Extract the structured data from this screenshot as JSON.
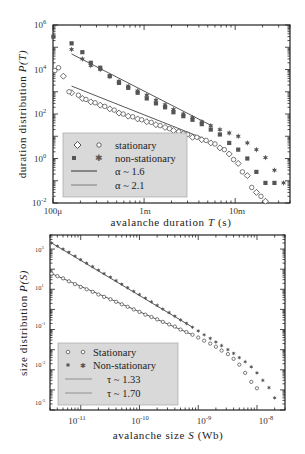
{
  "chart_data": [
    {
      "type": "scatter",
      "title": "",
      "xlabel": "avalanche duration T (s)",
      "ylabel": "duration distribution P(T)",
      "xscale": "log",
      "yscale": "log",
      "xlim": [
        0.0001,
        0.04
      ],
      "ylim": [
        0.01,
        1000000
      ],
      "xticks": [
        "100μ",
        "1m",
        "10m"
      ],
      "yticks": [
        "10^6",
        "10^4",
        "10^2",
        "10^0",
        "10^-2"
      ],
      "grid": false,
      "legend_position": "lower left",
      "legend": [
        "stationary",
        "non-stationary",
        "α ~ 1.6",
        "α ~ 2.1"
      ],
      "series": [
        {
          "name": "stationary (diamond)",
          "marker": "open-diamond",
          "x": [
            0.00013,
            0.00016,
            0.00021,
            0.00026,
            0.00033,
            0.00042,
            0.00053,
            0.00067,
            0.00085,
            0.00107,
            0.00135,
            0.0017,
            0.0021,
            0.0027,
            0.0034,
            0.0043,
            0.0054,
            0.0068,
            0.0086,
            0.0108,
            0.0136,
            0.0171,
            0.0215
          ],
          "y": [
            5000,
            900,
            500,
            350,
            250,
            170,
            110,
            80,
            60,
            45,
            33,
            25,
            18,
            13,
            9,
            7,
            5,
            3.0,
            1.6,
            0.6,
            0.17,
            0.03,
            0.012
          ]
        },
        {
          "name": "stationary (circle)",
          "marker": "open-circle",
          "x": [
            0.000105,
            0.000115,
            0.00015,
            0.00019,
            0.00023,
            0.00029,
            0.00037,
            0.00047,
            0.00059,
            0.00075,
            0.00094,
            0.0012,
            0.0015,
            0.0019,
            0.0024,
            0.003,
            0.0038,
            0.0048,
            0.006,
            0.0076,
            0.0096,
            0.012,
            0.0152,
            0.0192
          ],
          "y": [
            9000,
            12000,
            1000,
            700,
            450,
            320,
            220,
            150,
            100,
            75,
            55,
            42,
            30,
            22,
            16,
            12,
            9,
            6.5,
            4.5,
            2.5,
            0.9,
            0.25,
            0.05,
            0.02
          ]
        },
        {
          "name": "non-stationary (square)",
          "marker": "filled-square",
          "x": [
            0.000101,
            0.00016,
            0.00021,
            0.00026,
            0.00033,
            0.00042,
            0.00053,
            0.00067,
            0.00085,
            0.00107,
            0.00135,
            0.0017,
            0.0021,
            0.0027,
            0.0034,
            0.0043,
            0.0054,
            0.0068,
            0.0086,
            0.0108,
            0.0136,
            0.0171,
            0.0215,
            0.027
          ],
          "y": [
            300000,
            150000,
            60000,
            20000,
            12000,
            5000,
            2500,
            1500,
            900,
            500,
            300,
            200,
            120,
            80,
            55,
            35,
            20,
            12,
            5,
            2.5,
            1.0,
            0.25,
            0.08,
            0.08
          ]
        },
        {
          "name": "non-stationary (star)",
          "marker": "filled-star",
          "x": [
            0.00016,
            0.00021,
            0.00026,
            0.00033,
            0.00042,
            0.00053,
            0.00067,
            0.00085,
            0.00107,
            0.00135,
            0.0017,
            0.0021,
            0.0027,
            0.0034,
            0.0043,
            0.0054,
            0.0068,
            0.0086,
            0.0108,
            0.0136,
            0.0171,
            0.0215,
            0.027,
            0.034
          ],
          "y": [
            80000,
            30000,
            15000,
            10000,
            5000,
            3000,
            1800,
            1100,
            700,
            420,
            260,
            160,
            100,
            70,
            45,
            30,
            20,
            14,
            10,
            5,
            2.5,
            1.1,
            0.3,
            0.08
          ]
        },
        {
          "name": "α ~ 1.6",
          "type": "line",
          "x": [
            0.00016,
            0.0045
          ],
          "y": [
            1800,
            8
          ]
        },
        {
          "name": "α ~ 2.1",
          "type": "line",
          "x": [
            0.00016,
            0.0055
          ],
          "y": [
            50000,
            30
          ]
        }
      ]
    },
    {
      "type": "scatter",
      "title": "",
      "xlabel": "avalanche size S (Wb)",
      "ylabel": "size distribution P(S)",
      "xscale": "log",
      "yscale": "log",
      "xlim": [
        3e-12,
        3e-08
      ],
      "ylim": [
        1e-05,
        5000
      ],
      "xticks": [
        "10^-11",
        "10^-10",
        "10^-9",
        "10^-8"
      ],
      "yticks": [
        "10^3",
        "10^1",
        "10^-1",
        "10^-3",
        "10^-5"
      ],
      "grid": false,
      "legend_position": "lower left",
      "legend": [
        "Stationary",
        "Non-stationary",
        "τ ~ 1.33",
        "τ ~ 1.70"
      ],
      "series": [
        {
          "name": "Stationary",
          "marker": "open-circle",
          "x": [
            3.2e-12,
            4e-12,
            5e-12,
            6.3e-12,
            8e-12,
            1e-11,
            1.26e-11,
            1.6e-11,
            2e-11,
            2.5e-11,
            3.2e-11,
            4e-11,
            5e-11,
            6.3e-11,
            8e-11,
            1e-10,
            1.26e-10,
            1.6e-10,
            2e-10,
            2.5e-10,
            3.2e-10,
            4e-10,
            5e-10,
            6.3e-10,
            8e-10,
            1e-09,
            1.26e-09,
            1.6e-09,
            2e-09,
            2.5e-09,
            3.2e-09,
            4e-09,
            5e-09,
            6.3e-09,
            8e-09,
            1e-08
          ],
          "y": [
            60,
            45,
            35,
            25,
            18,
            13,
            10,
            7.5,
            5.5,
            4.2,
            3.2,
            2.4,
            1.8,
            1.35,
            1.0,
            0.75,
            0.55,
            0.42,
            0.32,
            0.24,
            0.18,
            0.14,
            0.1,
            0.075,
            0.055,
            0.04,
            0.028,
            0.02,
            0.014,
            0.009,
            0.006,
            0.0035,
            0.0018,
            0.0007,
            0.00025,
            0.00012
          ]
        },
        {
          "name": "Non-stationary",
          "marker": "filled-star",
          "x": [
            3.2e-12,
            4e-12,
            5e-12,
            6.3e-12,
            8e-12,
            1e-11,
            1.26e-11,
            1.6e-11,
            2e-11,
            2.5e-11,
            3.2e-11,
            4e-11,
            5e-11,
            6.3e-11,
            8e-11,
            1e-10,
            1.26e-10,
            1.6e-10,
            2e-10,
            2.5e-10,
            3.2e-10,
            4e-10,
            5e-10,
            6.3e-10,
            8e-10,
            1e-09,
            1.26e-09,
            1.6e-09,
            2e-09,
            2.5e-09,
            3.2e-09,
            4e-09,
            5e-09,
            6.3e-09,
            8e-09,
            1e-08,
            1.26e-08,
            1.6e-08,
            2e-08
          ],
          "y": [
            2000,
            1400,
            1000,
            700,
            450,
            300,
            200,
            135,
            90,
            60,
            40,
            27,
            18,
            12,
            8,
            5.5,
            3.6,
            2.4,
            1.6,
            1.05,
            0.7,
            0.46,
            0.3,
            0.2,
            0.13,
            0.085,
            0.055,
            0.036,
            0.024,
            0.016,
            0.01,
            0.0065,
            0.004,
            0.0025,
            0.0014,
            0.0007,
            0.0003,
            0.00013,
            4e-05
          ]
        },
        {
          "name": "τ ~ 1.33",
          "type": "line",
          "x": [
            3.2e-12,
            8e-10
          ],
          "y": [
            60,
            0.055
          ]
        },
        {
          "name": "τ ~ 1.70",
          "type": "line",
          "x": [
            3.2e-12,
            8e-10
          ],
          "y": [
            2000,
            0.13
          ]
        }
      ]
    }
  ],
  "top_chart": {
    "ylabel_prefix": "duration distribution ",
    "ylabel_var": "P(T)",
    "xlabel_prefix": "avalanche duration ",
    "xlabel_var": "T",
    "xlabel_suffix": " (s)",
    "yticks": [
      {
        "base": "10",
        "exp": "6"
      },
      {
        "base": "10",
        "exp": "4"
      },
      {
        "base": "10",
        "exp": "2"
      },
      {
        "base": "10",
        "exp": "0"
      },
      {
        "base": "10",
        "exp": "-2"
      }
    ],
    "xticks": [
      "100μ",
      "1m",
      "10m"
    ],
    "legend": {
      "row1": "stationary",
      "row2": "non-stationary",
      "row3": "α ~ 1.6",
      "row4": "α ~ 2.1"
    }
  },
  "bottom_chart": {
    "ylabel_prefix": "size distribution ",
    "ylabel_var": "P(S)",
    "xlabel_prefix": "avalanche size ",
    "xlabel_var": "S",
    "xlabel_suffix": " (Wb)",
    "yticks": [
      {
        "base": "10",
        "exp": "3"
      },
      {
        "base": "10",
        "exp": "1"
      },
      {
        "base": "10",
        "exp": "-1"
      },
      {
        "base": "10",
        "exp": "-3"
      },
      {
        "base": "10",
        "exp": "-5"
      }
    ],
    "xticks": [
      {
        "base": "10",
        "exp": "-11"
      },
      {
        "base": "10",
        "exp": "-10"
      },
      {
        "base": "10",
        "exp": "-9"
      },
      {
        "base": "10",
        "exp": "-8"
      }
    ],
    "legend": {
      "row1": "Stationary",
      "row2": "Non-stationary",
      "row3": "τ ~ 1.33",
      "row4": "τ ~ 1.70"
    }
  },
  "colors": {
    "marker_dark": "#555555",
    "marker_open": "#444444",
    "fit_line": "#555555",
    "legend_bg": "#d9d9d9",
    "frame": "#222222"
  }
}
